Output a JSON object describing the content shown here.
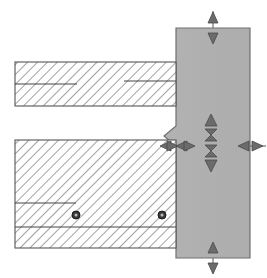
{
  "document": {
    "title": "Structural Connection Detail",
    "drawing_type": "section",
    "width": 267,
    "height": 278,
    "background_color": "#ffffff"
  },
  "colors": {
    "background": "#ffffff",
    "column_fill": "#b0b0b0",
    "column_stroke": "#707070",
    "beam_fill": "#ffffff",
    "beam_stroke": "#555555",
    "hatch_line": "#555555",
    "arrow_fill": "#6b6b6b",
    "arrow_stroke": "#4a4a4a",
    "fastener_fill": "#3a3a3a",
    "fastener_stroke": "#1a1a1a",
    "leader_line": "#555555"
  },
  "elements": {
    "column": {
      "name": "vertical-column",
      "fill": "#b0b0b0",
      "x": 176,
      "y": 28,
      "width": 74,
      "height": 230,
      "notch": {
        "name": "column-notch",
        "top_y": 126,
        "bottom_y": 146,
        "depth": 12
      }
    },
    "upper_beam": {
      "name": "upper-horizontal-beam",
      "x": 15,
      "y": 62,
      "width": 161,
      "height": 44,
      "hatch_angle_deg": 45,
      "inner_lines": [
        {
          "y": 84,
          "x1": 15,
          "x2": 75
        },
        {
          "y": 81,
          "x1": 125,
          "x2": 176
        }
      ]
    },
    "lower_beam": {
      "name": "lower-horizontal-beam",
      "x": 15,
      "y": 140,
      "width": 161,
      "height": 108,
      "hatch_angle_deg": 45,
      "inner_lines": [
        {
          "y": 203,
          "x1": 15,
          "x2": 75
        },
        {
          "y": 226,
          "x1": 15,
          "x2": 176
        }
      ]
    },
    "fasteners": [
      {
        "name": "fastener-left",
        "cx": 76,
        "cy": 215,
        "r": 4
      },
      {
        "name": "fastener-right",
        "cx": 162,
        "cy": 215,
        "r": 4
      }
    ]
  },
  "dimension_markers": [
    {
      "name": "dimension-arrow-column-top",
      "orientation": "vertical",
      "style": "opposed-pair",
      "x": 213,
      "y": 28,
      "label": ""
    },
    {
      "name": "dimension-arrow-column-bottom",
      "orientation": "vertical",
      "style": "opposed-pair",
      "x": 213,
      "y": 258,
      "label": ""
    },
    {
      "name": "dimension-arrow-stack-upper",
      "orientation": "vertical",
      "style": "arrow-up",
      "x": 211,
      "y": 125,
      "label": ""
    },
    {
      "name": "dimension-arrow-stack-mid-a",
      "orientation": "vertical",
      "style": "hourglass",
      "x": 211,
      "y": 135,
      "label": ""
    },
    {
      "name": "dimension-arrow-stack-mid-b",
      "orientation": "vertical",
      "style": "hourglass",
      "x": 211,
      "y": 148,
      "label": ""
    },
    {
      "name": "dimension-arrow-stack-lower",
      "orientation": "vertical",
      "style": "arrow-down",
      "x": 211,
      "y": 159,
      "label": ""
    },
    {
      "name": "dimension-arrow-interface-left",
      "orientation": "horizontal",
      "style": "opposed-pair",
      "x": 168,
      "y": 146,
      "label": ""
    },
    {
      "name": "dimension-arrow-interface-mid",
      "orientation": "horizontal",
      "style": "opposed-pair",
      "x": 182,
      "y": 146,
      "label": ""
    },
    {
      "name": "dimension-arrow-column-right",
      "orientation": "horizontal",
      "style": "opposed-pair",
      "x": 250,
      "y": 146,
      "label": ""
    }
  ],
  "leader_lines": [
    {
      "name": "leader-top-vertical",
      "x1": 213,
      "y1": 10,
      "x2": 213,
      "y2": 46
    },
    {
      "name": "leader-bottom-vertical",
      "x1": 213,
      "y1": 242,
      "x2": 213,
      "y2": 274
    },
    {
      "name": "leader-interface-horizontal",
      "x1": 158,
      "y1": 146,
      "x2": 200,
      "y2": 146
    },
    {
      "name": "leader-right-horizontal",
      "x1": 236,
      "y1": 146,
      "x2": 266,
      "y2": 146
    }
  ]
}
